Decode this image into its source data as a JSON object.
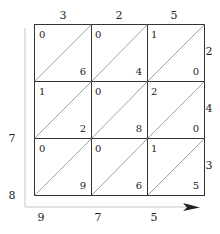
{
  "diagram": {
    "type": "lattice-multiplication",
    "multiplicand_digits": [
      "3",
      "2",
      "5"
    ],
    "multiplier_digits": [
      "2",
      "4",
      "3"
    ],
    "grid": [
      [
        {
          "tens": "0",
          "ones": "6"
        },
        {
          "tens": "0",
          "ones": "4"
        },
        {
          "tens": "1",
          "ones": "0"
        }
      ],
      [
        {
          "tens": "1",
          "ones": "2"
        },
        {
          "tens": "0",
          "ones": "8"
        },
        {
          "tens": "2",
          "ones": "0"
        }
      ],
      [
        {
          "tens": "0",
          "ones": "9"
        },
        {
          "tens": "0",
          "ones": "6"
        },
        {
          "tens": "1",
          "ones": "5"
        }
      ]
    ],
    "left_result_digits": [
      "7",
      "8"
    ],
    "bottom_result_digits": [
      "9",
      "7",
      "5"
    ],
    "colors": {
      "grid": "#333333",
      "diagonal": "#888888",
      "axis": "#bbbbbb",
      "arrow": "#222222"
    }
  }
}
